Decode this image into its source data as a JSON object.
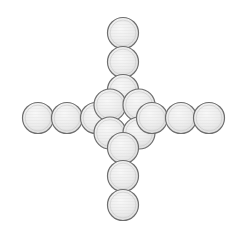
{
  "image": {
    "title": "Plus-shaped arrangement of circular discs",
    "width": 242,
    "height": 237,
    "background_color": "#ffffff",
    "subject": "coins",
    "shape": "plus-cross",
    "disc_count": 16,
    "disc_diameter": 31
  },
  "style": {
    "fill_light": "#f2f2f2",
    "fill_mid": "#e4e4e4",
    "fill_shadow": "#d2d2d2",
    "stroke_color": "#6e6e6e",
    "stroke_width": 1.2,
    "texture_color": "#cfcfcf"
  },
  "groups": [
    {
      "name": "top-arm",
      "label": "Top arm",
      "count": 3
    },
    {
      "name": "bottom-arm",
      "label": "Bottom arm",
      "count": 3
    },
    {
      "name": "left-arm",
      "label": "Left arm",
      "count": 3
    },
    {
      "name": "right-arm",
      "label": "Right arm",
      "count": 3
    },
    {
      "name": "center-cluster",
      "label": "Center cluster",
      "count": 4
    }
  ],
  "discs": [
    {
      "id": "top-1",
      "group": "top-arm",
      "cx": 123,
      "cy": 33,
      "r": 15.5
    },
    {
      "id": "top-2",
      "group": "top-arm",
      "cx": 123,
      "cy": 62,
      "r": 15.5
    },
    {
      "id": "top-3",
      "group": "top-arm",
      "cx": 123,
      "cy": 90,
      "r": 15.5
    },
    {
      "id": "left-1",
      "group": "left-arm",
      "cx": 38,
      "cy": 118,
      "r": 15.5
    },
    {
      "id": "left-2",
      "group": "left-arm",
      "cx": 67,
      "cy": 118,
      "r": 15.5
    },
    {
      "id": "left-3",
      "group": "left-arm",
      "cx": 96,
      "cy": 118,
      "r": 15.5
    },
    {
      "id": "center-1",
      "group": "center-cluster",
      "cx": 110,
      "cy": 105,
      "r": 16.0
    },
    {
      "id": "center-2",
      "group": "center-cluster",
      "cx": 139,
      "cy": 105,
      "r": 16.0
    },
    {
      "id": "center-3",
      "group": "center-cluster",
      "cx": 110,
      "cy": 133,
      "r": 16.0
    },
    {
      "id": "center-4",
      "group": "center-cluster",
      "cx": 139,
      "cy": 133,
      "r": 16.0
    },
    {
      "id": "right-1",
      "group": "right-arm",
      "cx": 152,
      "cy": 118,
      "r": 15.5
    },
    {
      "id": "right-2",
      "group": "right-arm",
      "cx": 181,
      "cy": 118,
      "r": 15.5
    },
    {
      "id": "right-3",
      "group": "right-arm",
      "cx": 209,
      "cy": 118,
      "r": 15.5
    },
    {
      "id": "bottom-1",
      "group": "bottom-arm",
      "cx": 123,
      "cy": 148,
      "r": 15.5
    },
    {
      "id": "bottom-2",
      "group": "bottom-arm",
      "cx": 123,
      "cy": 176,
      "r": 15.5
    },
    {
      "id": "bottom-3",
      "group": "bottom-arm",
      "cx": 123,
      "cy": 205,
      "r": 15.5
    }
  ]
}
